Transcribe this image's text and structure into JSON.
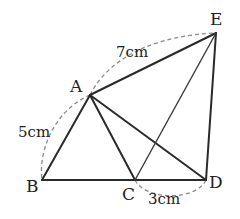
{
  "diagram": {
    "points": {
      "A": {
        "label": "A",
        "x": 90,
        "y": 95
      },
      "B": {
        "label": "B",
        "x": 42,
        "y": 180
      },
      "C": {
        "label": "C",
        "x": 135,
        "y": 180
      },
      "D": {
        "label": "D",
        "x": 206,
        "y": 180
      },
      "E": {
        "label": "E",
        "x": 216,
        "y": 33
      }
    },
    "segments": [
      {
        "from": "A",
        "to": "B"
      },
      {
        "from": "B",
        "to": "D"
      },
      {
        "from": "A",
        "to": "C"
      },
      {
        "from": "A",
        "to": "D"
      },
      {
        "from": "A",
        "to": "E"
      },
      {
        "from": "E",
        "to": "D"
      },
      {
        "from": "C",
        "to": "E"
      }
    ],
    "measurements": {
      "AB": "5cm",
      "AE": "7cm",
      "CD": "3cm"
    },
    "colors": {
      "line": "#2a2a2a",
      "dashed_arc": "#8a8a8a",
      "text": "#222222"
    }
  }
}
